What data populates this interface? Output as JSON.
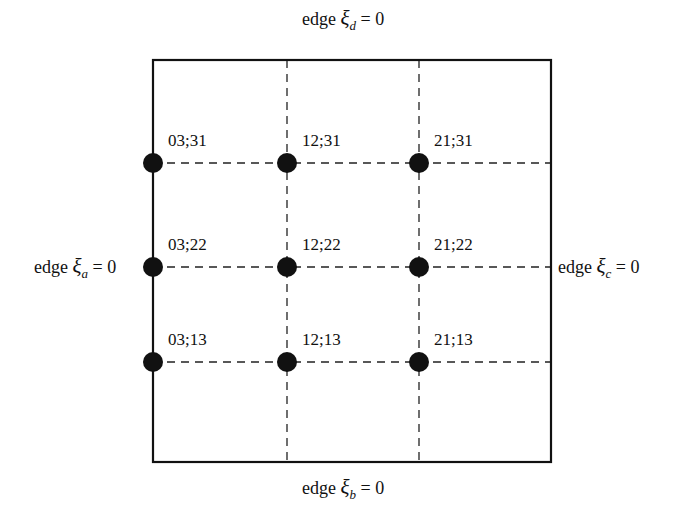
{
  "diagram": {
    "type": "element-node-layout",
    "box": {
      "left": 153,
      "top": 60,
      "right": 551,
      "bottom": 462,
      "stroke": "#111111",
      "stroke_width": 2.2
    },
    "grid_lines": {
      "vertical_x": [
        287,
        419
      ],
      "horizontal_y": [
        163,
        267,
        362
      ],
      "dash": "8 6",
      "stroke": "#222222"
    },
    "edges": {
      "top": {
        "prefix": "edge ",
        "symbol": "ξ",
        "subscript": "d",
        "suffix": " = 0"
      },
      "bottom": {
        "prefix": "edge ",
        "symbol": "ξ",
        "subscript": "b",
        "suffix": " = 0"
      },
      "left": {
        "prefix": "edge ",
        "symbol": "ξ",
        "subscript": "a",
        "suffix": " = 0"
      },
      "right": {
        "prefix": "edge ",
        "symbol": "ξ",
        "subscript": "c",
        "suffix": " = 0"
      }
    },
    "node_radius": 10,
    "node_color": "#111111",
    "nodes": [
      {
        "label": "03;31",
        "x": 153,
        "y": 163
      },
      {
        "label": "12;31",
        "x": 287,
        "y": 163
      },
      {
        "label": "21;31",
        "x": 419,
        "y": 163
      },
      {
        "label": "03;22",
        "x": 153,
        "y": 267
      },
      {
        "label": "12;22",
        "x": 287,
        "y": 267
      },
      {
        "label": "21;22",
        "x": 419,
        "y": 267
      },
      {
        "label": "03;13",
        "x": 153,
        "y": 362
      },
      {
        "label": "12;13",
        "x": 287,
        "y": 362
      },
      {
        "label": "21;13",
        "x": 419,
        "y": 362
      }
    ]
  }
}
